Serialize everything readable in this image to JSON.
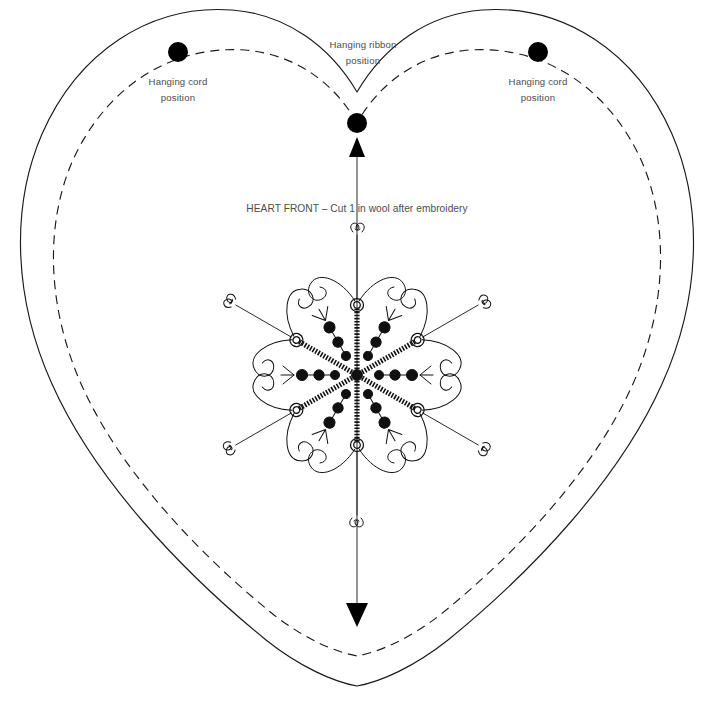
{
  "sheet": {
    "title": "HEART FRONT – Cut 1 in wool after embroidery",
    "background_color": "#ffffff",
    "ink_color": "#1a1a1a",
    "text_color": "#4d4d4d",
    "width": 710,
    "height": 711
  },
  "labels": {
    "hanging_cord_left_line1": "Hanging cord",
    "hanging_cord_left_line2": "position",
    "hanging_ribbon_line1": "Hanging ribbon",
    "hanging_ribbon_line2": "position",
    "hanging_cord_right_line1": "Hanging cord",
    "hanging_cord_right_line2": "position",
    "caption": "HEART FRONT – Cut 1 in wool after embroidery"
  },
  "markers": [
    {
      "name": "hanging-cord-left",
      "x": 178,
      "y": 52,
      "r": 10
    },
    {
      "name": "hanging-ribbon-center",
      "x": 357,
      "y": 123,
      "r": 10
    },
    {
      "name": "hanging-cord-right",
      "x": 538,
      "y": 52,
      "r": 10
    }
  ],
  "guides": {
    "grain_line_top_y": 140,
    "grain_line_bottom_y": 622,
    "grain_line_x": 357,
    "arrow_up_label": "grain-arrow-up",
    "arrow_down_label": "grain-arrow-down"
  },
  "motif": {
    "name": "snowflake-embroidery-motif",
    "center_x": 357,
    "center_y": 375,
    "arms": 6,
    "ray_length": 72,
    "elements": [
      "chain-stitch-rays",
      "french-knots",
      "fly-stitches",
      "spiral-curls",
      "double-spiral-tips"
    ]
  },
  "heart": {
    "outline_type": "cut-line",
    "inner_type": "seam-line-dashed",
    "top_notch_x": 357,
    "top_notch_y": 92,
    "bottom_point_x": 357,
    "bottom_point_y": 686
  }
}
